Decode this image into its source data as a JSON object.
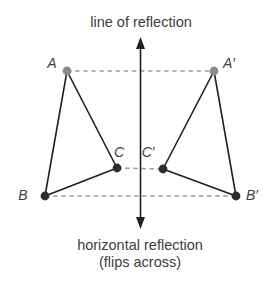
{
  "title": {
    "text": "line of reflection"
  },
  "caption": {
    "line1": "horizontal reflection",
    "line2": "(flips across)"
  },
  "colors": {
    "background": "#ffffff",
    "solid_line": "#1f1f1f",
    "dashed_line": "#999999",
    "preimage_top_dot": "#8a8a8a",
    "dark_dot": "#2d2d2d",
    "text": "#3d3d3d"
  },
  "axis": {
    "x": 140.5,
    "top_tip_y": 37,
    "bottom_tip_y": 229
  },
  "points": {
    "A": {
      "label": "A",
      "x": 67,
      "y": 71,
      "dot": "gray",
      "label_x": 52,
      "label_y": 68
    },
    "Ap": {
      "label": "A′",
      "x": 214,
      "y": 71,
      "dot": "gray",
      "label_x": 229,
      "label_y": 68
    },
    "B": {
      "label": "B",
      "x": 45,
      "y": 196,
      "dot": "dark",
      "label_x": 23,
      "label_y": 200
    },
    "Bp": {
      "label": "B′",
      "x": 236,
      "y": 196,
      "dot": "dark",
      "label_x": 252,
      "label_y": 200
    },
    "C": {
      "label": "C",
      "x": 117,
      "y": 168,
      "dot": "dark",
      "label_x": 119,
      "label_y": 157
    },
    "Cp": {
      "label": "C′",
      "x": 163,
      "y": 169,
      "dot": "dark",
      "label_x": 148,
      "label_y": 157
    }
  },
  "triangles": [
    [
      "A",
      "B",
      "C"
    ],
    [
      "Ap",
      "Bp",
      "Cp"
    ]
  ],
  "dashed_segments": [
    [
      "A",
      "Ap"
    ],
    [
      "C",
      "Cp"
    ],
    [
      "B",
      "Bp"
    ]
  ]
}
